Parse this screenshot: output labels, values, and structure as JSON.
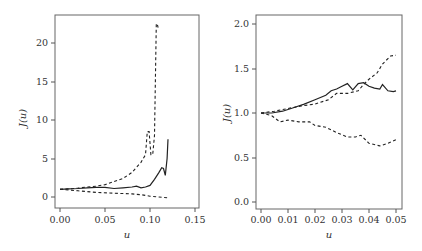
{
  "chart_data": [
    {
      "type": "line",
      "title": "",
      "xlabel": "u",
      "ylabel": "J(u)",
      "xlim": [
        0.0,
        0.15
      ],
      "ylim": [
        -1,
        24
      ],
      "xticks": [
        "0.00",
        "0.05",
        "0.10",
        "0.15"
      ],
      "yticks": [
        "0",
        "5",
        "10",
        "15",
        "20"
      ],
      "grid": false,
      "legend": null,
      "series": [
        {
          "name": "estimate",
          "style": "solid",
          "x": [
            0.0,
            0.01,
            0.02,
            0.03,
            0.04,
            0.05,
            0.06,
            0.07,
            0.08,
            0.085,
            0.09,
            0.095,
            0.1,
            0.105,
            0.11,
            0.113,
            0.115,
            0.117,
            0.119,
            0.12
          ],
          "y": [
            1.0,
            1.05,
            1.1,
            1.2,
            1.25,
            1.25,
            1.1,
            1.2,
            1.3,
            1.4,
            1.2,
            1.3,
            1.5,
            2.3,
            3.2,
            3.8,
            3.7,
            2.8,
            5.0,
            7.5
          ]
        },
        {
          "name": "upper bound",
          "style": "dashed",
          "x": [
            0.0,
            0.01,
            0.02,
            0.03,
            0.04,
            0.05,
            0.06,
            0.07,
            0.08,
            0.09,
            0.095,
            0.097,
            0.099,
            0.101,
            0.103,
            0.105,
            0.107,
            0.108,
            0.109
          ],
          "y": [
            1.0,
            1.05,
            1.15,
            1.3,
            1.4,
            1.6,
            2.0,
            2.4,
            3.2,
            4.5,
            5.5,
            8.5,
            8.5,
            5.5,
            5.5,
            8.0,
            22.5,
            22.5,
            22.0
          ]
        },
        {
          "name": "lower bound",
          "style": "dashed",
          "x": [
            0.0,
            0.02,
            0.04,
            0.06,
            0.08,
            0.09,
            0.1,
            0.11,
            0.12
          ],
          "y": [
            1.0,
            0.8,
            0.6,
            0.5,
            0.4,
            0.3,
            0.1,
            0.0,
            -0.1
          ]
        }
      ]
    },
    {
      "type": "line",
      "title": "",
      "xlabel": "u",
      "ylabel": "J(u)",
      "xlim": [
        0.0,
        0.05
      ],
      "ylim": [
        -0.05,
        2.05
      ],
      "xticks": [
        "0.00",
        "0.01",
        "0.02",
        "0.03",
        "0.04",
        "0.05"
      ],
      "yticks": [
        "0.0",
        "0.5",
        "1.0",
        "1.5",
        "2.0"
      ],
      "grid": false,
      "legend": null,
      "series": [
        {
          "name": "estimate",
          "style": "solid",
          "x": [
            0.0,
            0.004,
            0.008,
            0.012,
            0.016,
            0.02,
            0.024,
            0.026,
            0.028,
            0.03,
            0.032,
            0.034,
            0.036,
            0.038,
            0.04,
            0.042,
            0.044,
            0.045,
            0.047,
            0.049,
            0.05
          ],
          "y": [
            1.0,
            1.0,
            1.02,
            1.06,
            1.1,
            1.15,
            1.2,
            1.25,
            1.27,
            1.3,
            1.33,
            1.26,
            1.33,
            1.34,
            1.3,
            1.28,
            1.27,
            1.32,
            1.25,
            1.24,
            1.25
          ],
          "labels": []
        },
        {
          "name": "upper bound",
          "style": "dashed",
          "x": [
            0.0,
            0.005,
            0.01,
            0.015,
            0.02,
            0.025,
            0.028,
            0.032,
            0.036,
            0.038,
            0.04,
            0.043,
            0.045,
            0.048,
            0.05
          ],
          "y": [
            1.0,
            1.02,
            1.05,
            1.08,
            1.1,
            1.15,
            1.22,
            1.22,
            1.25,
            1.32,
            1.38,
            1.45,
            1.55,
            1.64,
            1.65
          ]
        },
        {
          "name": "lower bound",
          "style": "dashed",
          "x": [
            0.0,
            0.004,
            0.007,
            0.01,
            0.014,
            0.018,
            0.02,
            0.024,
            0.028,
            0.032,
            0.035,
            0.037,
            0.04,
            0.044,
            0.047,
            0.05
          ],
          "y": [
            1.0,
            0.97,
            0.9,
            0.92,
            0.9,
            0.9,
            0.86,
            0.84,
            0.78,
            0.73,
            0.73,
            0.75,
            0.66,
            0.63,
            0.66,
            0.7
          ]
        }
      ]
    }
  ],
  "panels": [
    {
      "xlabel": "u",
      "ylabel": "J(u)",
      "xticks": [
        "0.00",
        "0.05",
        "0.10",
        "0.15"
      ],
      "yticks": [
        "0",
        "5",
        "10",
        "15",
        "20"
      ]
    },
    {
      "xlabel": "u",
      "ylabel": "J(u)",
      "xticks": [
        "0.00",
        "0.01",
        "0.02",
        "0.03",
        "0.04",
        "0.05"
      ],
      "yticks": [
        "0.0",
        "0.5",
        "1.0",
        "1.5",
        "2.0"
      ]
    }
  ],
  "colors": {
    "line": "#222222",
    "frame": "#555555",
    "text": "#333333"
  }
}
